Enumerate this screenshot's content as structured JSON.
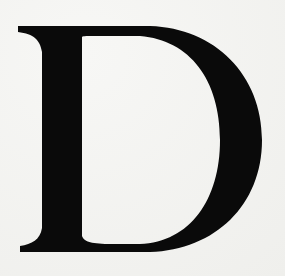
{
  "letter": "D",
  "colors": {
    "ink": "#0a0a0a",
    "paper": "#f3f3f1"
  }
}
